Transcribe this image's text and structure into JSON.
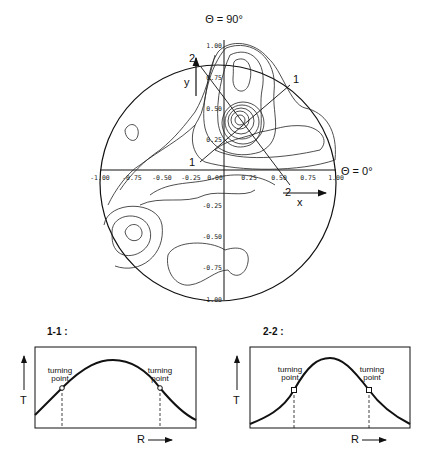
{
  "polar_plot": {
    "title_top": "Θ = 90°",
    "title_right": "Θ = 0°",
    "x_axis_label": "x",
    "y_axis_label": "y",
    "x_ticks": [
      "-1.00",
      "-0.75",
      "-0.50",
      "-0.25",
      "0.00",
      "0.25",
      "0.50",
      "0.75",
      "1.00"
    ],
    "y_ticks": [
      "1.00",
      "0.75",
      "0.50",
      "0.25",
      "-0.25",
      "-0.50",
      "-0.75",
      "-1.00"
    ],
    "section_1_label_start": "1",
    "section_1_label_end": "1",
    "section_2_label_start": "2",
    "section_2_label_end": "2",
    "peak_location": [
      0.25,
      0.25
    ]
  },
  "section_1_1": {
    "title": "1-1 :",
    "y_axis_label": "T",
    "x_axis_label": "R",
    "left_annotation_line1": "turning",
    "left_annotation_line2": "point",
    "right_annotation_line1": "turning",
    "right_annotation_line2": "point"
  },
  "section_2_2": {
    "title": "2-2 :",
    "y_axis_label": "T",
    "x_axis_label": "R",
    "left_annotation_line1": "turning",
    "left_annotation_line2": "point",
    "right_annotation_line1": "turning",
    "right_annotation_line2": "point"
  }
}
